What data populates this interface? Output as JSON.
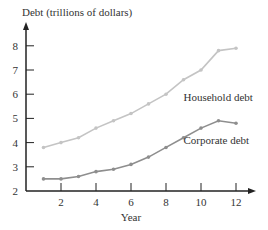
{
  "chart_data": {
    "type": "line",
    "title": "",
    "ylabel": "Debt (trillions of dollars)",
    "xlabel": "Year",
    "x": [
      1,
      2,
      3,
      4,
      5,
      6,
      7,
      8,
      9,
      10,
      11,
      12
    ],
    "xticks": [
      2,
      4,
      6,
      8,
      10,
      12
    ],
    "yticks": [
      2,
      3,
      4,
      5,
      6,
      7,
      8
    ],
    "xlim": [
      0,
      12.5
    ],
    "ylim": [
      2,
      8.7
    ],
    "grid": false,
    "legend": "inline labels",
    "series": [
      {
        "name": "Household debt",
        "color": "#c4c4c4",
        "values": [
          3.8,
          4.0,
          4.2,
          4.6,
          4.9,
          5.2,
          5.6,
          6.0,
          6.6,
          7.0,
          7.8,
          7.9
        ],
        "label_pos": {
          "x": 9.0,
          "y": 5.7
        }
      },
      {
        "name": "Corporate debt",
        "color": "#8e8e8e",
        "values": [
          2.5,
          2.5,
          2.6,
          2.8,
          2.9,
          3.1,
          3.4,
          3.8,
          4.2,
          4.6,
          4.9,
          4.8
        ],
        "label_pos": {
          "x": 9.0,
          "y": 3.95
        }
      }
    ]
  }
}
